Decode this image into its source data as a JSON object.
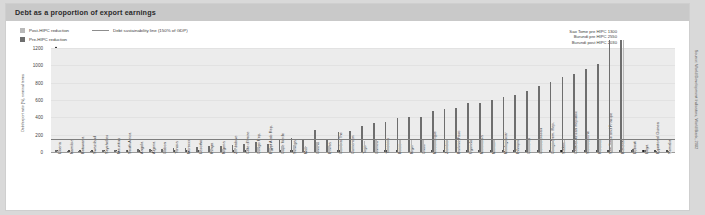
{
  "card": {
    "title": "Debt as a proportion of export earnings"
  },
  "legend": {
    "post_label": "Post-HIPC reduction",
    "pre_label": "Pre-HIPC reduction",
    "line_label": "Debt sustainability line (150% of GDP)",
    "post_color": "#b9b9b9",
    "pre_color": "#6e6e6e",
    "line_color": "#7e7e7e"
  },
  "annotations": [
    "Sao Tome pre HIPC 1300",
    "Burundi pre HIPC 2550",
    "Burundi post HIPC 2030"
  ],
  "side_source": "Source: World Development Indicators, World Bank, 2002",
  "chart_data": {
    "type": "bar",
    "title": "Debt as a proportion of export earnings",
    "xlabel": "",
    "ylabel": "Debt/export ratio (%), nominal terms",
    "ylim": [
      0,
      1200
    ],
    "yticks": [
      0,
      200,
      400,
      600,
      800,
      1000,
      1200
    ],
    "grid": true,
    "legend_position": "top-left",
    "annotation_line": {
      "label": "Debt sustainability line (150% of GDP)",
      "value": 150
    },
    "categories": [
      "Liberia",
      "Namibia",
      "Botswana",
      "Swaziland",
      "Seychelles",
      "Mauritius",
      "South Africa",
      "Angola",
      "Algeria",
      "Gabon",
      "Tunisia",
      "Morocco",
      "Lesotho",
      "Kenya",
      "Nigeria",
      "Zimbabwe",
      "Cote d'Ivoire",
      "Congo Rep.",
      "Egypt Arab Rep.",
      "Cape Verde",
      "Senegal",
      "Mali",
      "Ghana",
      "Eritrea",
      "Gambia The",
      "Cameroon",
      "Togo",
      "Guinea",
      "Tanzania",
      "Benin",
      "Niger",
      "Chad",
      "Mozambique",
      "Zambia",
      "Burkina Faso",
      "Uganda",
      "Mauritania",
      "Malawi",
      "Madagascar",
      "Ethiopia",
      "Comoros",
      "Guinea-Bissau",
      "Congo Dem. Rep.",
      "Sudan",
      "Central African Republic",
      "Sierra Leone",
      "Rwanda",
      "Sao Tome and Principe",
      "Burundi",
      "Djibouti",
      "Libya",
      "Equatorial Guinea",
      "Somalia"
    ],
    "series": [
      {
        "name": "Pre-HIPC reduction",
        "color": "#6e6e6e",
        "values": [
          20,
          10,
          12,
          14,
          18,
          22,
          26,
          30,
          34,
          40,
          44,
          50,
          58,
          66,
          74,
          82,
          90,
          120,
          96,
          150,
          165,
          150,
          250,
          150,
          235,
          245,
          300,
          330,
          345,
          390,
          400,
          400,
          470,
          500,
          510,
          560,
          560,
          600,
          630,
          660,
          700,
          760,
          810,
          860,
          900,
          960,
          1010,
          1300,
          2550,
          30,
          20,
          14,
          10
        ]
      },
      {
        "name": "Post-HIPC reduction",
        "color": "#b9b9b9",
        "values": [
          10,
          5,
          6,
          7,
          9,
          11,
          13,
          15,
          17,
          20,
          22,
          25,
          29,
          33,
          37,
          41,
          45,
          60,
          48,
          70,
          80,
          70,
          110,
          70,
          105,
          110,
          130,
          140,
          145,
          150,
          150,
          150,
          150,
          150,
          150,
          150,
          150,
          150,
          150,
          150,
          150,
          150,
          150,
          150,
          150,
          150,
          150,
          150,
          2030,
          15,
          10,
          7,
          5
        ]
      }
    ],
    "overflow_notes": [
      {
        "category": "Sao Tome and Principe",
        "series": "Pre-HIPC reduction",
        "value": 1300
      },
      {
        "category": "Burundi",
        "series": "Pre-HIPC reduction",
        "value": 2550
      },
      {
        "category": "Burundi",
        "series": "Post-HIPC reduction",
        "value": 2030
      }
    ]
  }
}
